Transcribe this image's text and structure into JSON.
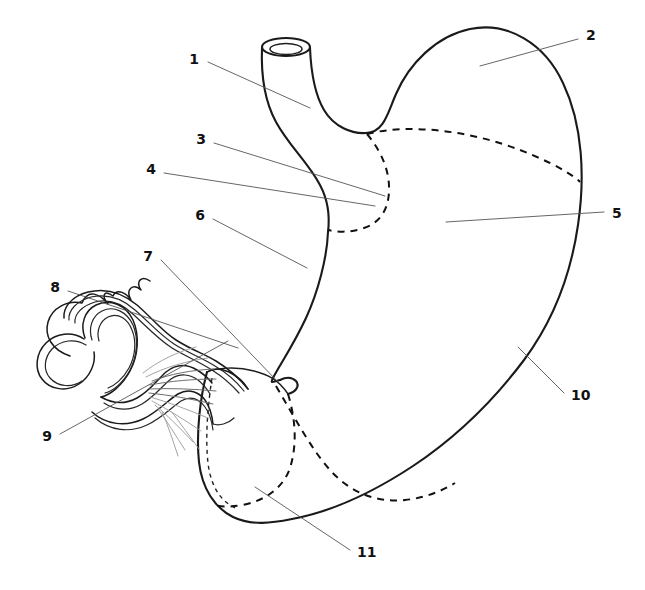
{
  "figure": {
    "type": "anatomical-line-diagram",
    "background_color": "#ffffff",
    "line_color": "#1a1a1a",
    "leader_color": "#555555",
    "width": 645,
    "height": 590
  },
  "labels": [
    {
      "id": "1",
      "text": "1",
      "x": 199,
      "y": 60,
      "anchor": "end",
      "leader": [
        [
          208,
          62
        ],
        [
          310,
          108
        ]
      ]
    },
    {
      "id": "2",
      "text": "2",
      "x": 586,
      "y": 36,
      "anchor": "start",
      "leader": [
        [
          578,
          39
        ],
        [
          480,
          66
        ]
      ]
    },
    {
      "id": "3",
      "text": "3",
      "x": 206,
      "y": 140,
      "anchor": "end",
      "leader": [
        [
          214,
          143
        ],
        [
          385,
          196
        ]
      ]
    },
    {
      "id": "4",
      "text": "4",
      "x": 156,
      "y": 170,
      "anchor": "end",
      "leader": [
        [
          164,
          173
        ],
        [
          375,
          206
        ]
      ]
    },
    {
      "id": "5",
      "text": "5",
      "x": 612,
      "y": 214,
      "anchor": "start",
      "leader": [
        [
          604,
          212
        ],
        [
          446,
          222
        ]
      ]
    },
    {
      "id": "6",
      "text": "6",
      "x": 205,
      "y": 216,
      "anchor": "end",
      "leader": [
        [
          213,
          219
        ],
        [
          307,
          268
        ]
      ]
    },
    {
      "id": "7",
      "text": "7",
      "x": 153,
      "y": 257,
      "anchor": "end",
      "leader": [
        [
          161,
          260
        ],
        [
          278,
          382
        ]
      ]
    },
    {
      "id": "8",
      "text": "8",
      "x": 60,
      "y": 288,
      "anchor": "end",
      "leader": [
        [
          68,
          291
        ],
        [
          238,
          348
        ]
      ]
    },
    {
      "id": "9",
      "text": "9",
      "x": 52,
      "y": 437,
      "anchor": "end",
      "leader": [
        [
          60,
          434
        ],
        [
          228,
          341
        ]
      ]
    },
    {
      "id": "10",
      "text": "10",
      "x": 571,
      "y": 396,
      "anchor": "start",
      "leader": [
        [
          564,
          393
        ],
        [
          518,
          347
        ]
      ]
    },
    {
      "id": "11",
      "text": "11",
      "x": 357,
      "y": 553,
      "anchor": "start",
      "leader": [
        [
          350,
          550
        ],
        [
          255,
          487
        ]
      ]
    }
  ],
  "structures": [
    {
      "name": "esophagus",
      "label_ref": "1"
    },
    {
      "name": "fundus",
      "label_ref": "2"
    },
    {
      "name": "cardiac-notch",
      "label_ref": "3"
    },
    {
      "name": "cardia",
      "label_ref": "4"
    },
    {
      "name": "body-of-stomach",
      "label_ref": "5"
    },
    {
      "name": "lesser-curvature",
      "label_ref": "6"
    },
    {
      "name": "angular-incisure",
      "label_ref": "7"
    },
    {
      "name": "duodenum",
      "label_ref": "8"
    },
    {
      "name": "duodenal-bulb",
      "label_ref": "9"
    },
    {
      "name": "greater-curvature",
      "label_ref": "10"
    },
    {
      "name": "pyloric-antrum",
      "label_ref": "11"
    }
  ]
}
